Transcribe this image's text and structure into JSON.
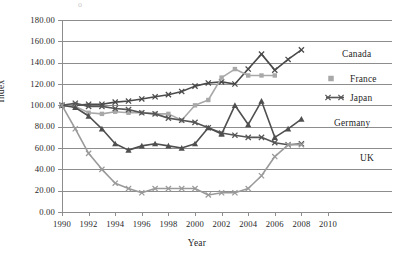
{
  "artifact": {
    "text": "o"
  },
  "chart_data": {
    "type": "line",
    "title": "",
    "xlabel": "Year",
    "ylabel": "Index",
    "xlim": [
      1990,
      2010
    ],
    "ylim": [
      0,
      180
    ],
    "grid": true,
    "legend_position": "right",
    "xticks": [
      "1990",
      "1992",
      "1994",
      "1996",
      "1998",
      "2000",
      "2002",
      "2004",
      "2006",
      "2008",
      "2010"
    ],
    "yticks": [
      "0.00",
      "20.00",
      "40.00",
      "60.00",
      "80.00",
      "100.00",
      "120.00",
      "140.00",
      "160.00",
      "180.00"
    ],
    "x": [
      1990,
      1991,
      1992,
      1993,
      1994,
      1995,
      1996,
      1997,
      1998,
      1999,
      2000,
      2001,
      2002,
      2003,
      2004,
      2005,
      2006,
      2007,
      2008
    ],
    "series": [
      {
        "name": "Canada",
        "color": "#4a4a4a",
        "marker": "x",
        "values": [
          100,
          100,
          101,
          101,
          103,
          104,
          106,
          108,
          110,
          113,
          118,
          121,
          122,
          120,
          134,
          148,
          133,
          143,
          152
        ]
      },
      {
        "name": "France",
        "color": "#a8a8a8",
        "marker": "square",
        "values": [
          100,
          99,
          93,
          92,
          94,
          93,
          93,
          92,
          92,
          86,
          100,
          105,
          126,
          134,
          128,
          128,
          128,
          null,
          null
        ]
      },
      {
        "name": "Japan",
        "color": "#555555",
        "marker": "x",
        "values": [
          100,
          102,
          99,
          99,
          97,
          96,
          93,
          92,
          88,
          86,
          84,
          79,
          74,
          72,
          70,
          70,
          65,
          63,
          64
        ]
      },
      {
        "name": "Germany",
        "color": "#4f4f4f",
        "marker": "triangle",
        "values": [
          100,
          98,
          90,
          78,
          64,
          58,
          62,
          64,
          62,
          60,
          64,
          79,
          73,
          100,
          82,
          104,
          70,
          78,
          87
        ]
      },
      {
        "name": "UK",
        "color": "#9a9a9a",
        "marker": "x",
        "values": [
          100,
          78,
          55,
          40,
          27,
          22,
          18,
          22,
          22,
          22,
          22,
          16,
          18,
          18,
          22,
          34,
          52,
          63,
          63
        ]
      }
    ]
  },
  "legend": {
    "items": [
      {
        "label": "Canada"
      },
      {
        "label": "France"
      },
      {
        "label": "Japan"
      },
      {
        "label": "Germany"
      },
      {
        "label": "UK"
      }
    ]
  }
}
